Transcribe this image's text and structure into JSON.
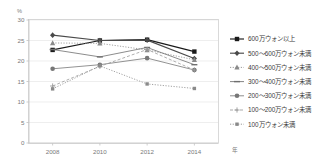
{
  "chart_data": {
    "type": "line",
    "title": "",
    "subtitle": "",
    "xlabel": "年",
    "ylabel": "%",
    "x": [
      2008,
      2010,
      2012,
      2014
    ],
    "categories": [
      "2008",
      "2010",
      "2012",
      "2014"
    ],
    "xtick_labels": [
      "2008",
      "2010",
      "2012",
      "2014"
    ],
    "ytick_labels": [
      "0",
      "5",
      "10",
      "15",
      "20",
      "25",
      "30"
    ],
    "ytick_values": [
      0,
      5,
      10,
      15,
      20,
      25,
      30
    ],
    "ylim": [
      0,
      30
    ],
    "grid": true,
    "grid_axis": "y",
    "legend_position": "right",
    "series": [
      {
        "name": "600万ウォン以上",
        "marker": "square",
        "color": "#1a1a1a",
        "linestyle": "solid",
        "values": [
          22.7,
          25.0,
          25.2,
          22.3
        ]
      },
      {
        "name": "500〜600万ウォン未満",
        "marker": "diamond",
        "color": "#4a4a4a",
        "linestyle": "solid",
        "values": [
          26.3,
          25.0,
          25.1,
          20.6
        ]
      },
      {
        "name": "400〜500万ウォン未満",
        "marker": "triangle",
        "color": "#8a8a8a",
        "linestyle": "dotted",
        "values": [
          24.4,
          24.3,
          22.7,
          20.3
        ]
      },
      {
        "name": "300〜400万ウォン未満",
        "marker": "dash",
        "color": "#6e6e6e",
        "linestyle": "solid",
        "values": [
          22.8,
          21.0,
          23.3,
          19.1
        ]
      },
      {
        "name": "200〜300万ウォン未満",
        "marker": "circle",
        "color": "#777777",
        "linestyle": "solid",
        "values": [
          18.1,
          19.1,
          20.7,
          17.8
        ]
      },
      {
        "name": "100〜200万ウォン未満",
        "marker": "plus",
        "color": "#9a9a9a",
        "linestyle": "dashed",
        "values": [
          13.9,
          18.7,
          22.8,
          17.8
        ]
      },
      {
        "name": "100万ウォン未満",
        "marker": "small-square",
        "color": "#8a8a8a",
        "linestyle": "dotted",
        "values": [
          13.2,
          18.8,
          14.4,
          13.3
        ]
      }
    ]
  },
  "axes": {
    "y_unit_label": "%",
    "x_unit_label": "年"
  }
}
